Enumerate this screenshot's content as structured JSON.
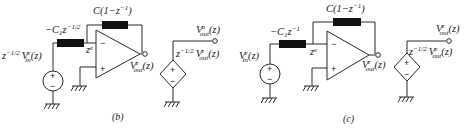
{
  "figure": {
    "panels": [
      {
        "id": "b",
        "caption": "(b)",
        "input_source_label": {
          "prefix": "z",
          "prefix_exp": "−1/2",
          "name": "V",
          "name_sup": "e",
          "name_sub": "in",
          "arg": "(z)"
        },
        "input_branch_label": {
          "prefix": "−C",
          "sub": "1",
          "z": "z",
          "exp": "−1/2"
        },
        "feedback_label": {
          "text": "C(1−z",
          "exp": "−1",
          "close": ")"
        },
        "node_label": {
          "z": "z",
          "sup": "e"
        },
        "opamp": {
          "minus": "−",
          "plus": "+"
        },
        "opamp_output_label": {
          "name": "V",
          "sup": "e",
          "sub": "out",
          "arg": "(z)"
        },
        "dependent_source_label": {
          "prefix": "z",
          "prefix_exp": "−1/2",
          "name": "V",
          "sup": "e",
          "sub": "out",
          "arg": "(z)"
        },
        "final_output_label": {
          "name": "V",
          "sup": "o",
          "sub": "out",
          "arg": "(z)"
        },
        "source_signs": {
          "plus": "+",
          "minus": "−"
        }
      },
      {
        "id": "c",
        "caption": "(c)",
        "input_source_label": {
          "prefix": "",
          "prefix_exp": "",
          "name": "V",
          "name_sup": "e",
          "name_sub": "in",
          "arg": "(z)"
        },
        "input_branch_label": {
          "prefix": "−C",
          "sub": "1",
          "z": "z",
          "exp": "−1"
        },
        "feedback_label": {
          "text": "C(1−z",
          "exp": "−1",
          "close": ")"
        },
        "node_label": {
          "z": "z",
          "sup": "e"
        },
        "opamp": {
          "minus": "−",
          "plus": "+"
        },
        "opamp_output_label": {
          "name": "V",
          "sup": "e",
          "sub": "out",
          "arg": "(z)"
        },
        "dependent_source_label": {
          "prefix": "z",
          "prefix_exp": "−1/2",
          "name": "V",
          "sup": "e",
          "sub": "out",
          "arg": "(z)"
        },
        "final_output_label": {
          "name": "V",
          "sup": "e",
          "sub": "out",
          "arg": "(z)"
        },
        "source_signs": {
          "plus": "+",
          "minus": "−"
        }
      }
    ]
  }
}
